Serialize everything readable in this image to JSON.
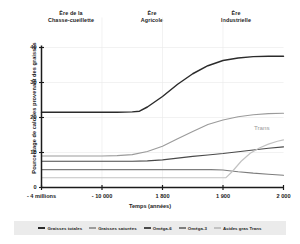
{
  "eras": [
    {
      "line1": "Ère de la",
      "line2": "Chasse-cueillette"
    },
    {
      "line1": "Ère",
      "line2": "Agricole"
    },
    {
      "line1": "Ère",
      "line2": "Industrielle"
    }
  ],
  "annotations": [
    {
      "text": "Trans",
      "color": "#9a9a9a"
    }
  ],
  "legend": [
    {
      "label": "Graisses totales",
      "color": "#2b2b2b"
    },
    {
      "label": "Graisses saturées",
      "color": "#9b9b9b"
    },
    {
      "label": "Oméga-6",
      "color": "#4a4a4a"
    },
    {
      "label": "Oméga-3",
      "color": "#7d7d7d"
    },
    {
      "label": "Acides gras Trans",
      "color": "#c2c2c2"
    }
  ],
  "chart_data": {
    "type": "line",
    "title": "",
    "xlabel": "Temps (années)",
    "ylabel": "Pourcentage de calories provenant des graisses",
    "ylim": [
      0,
      40
    ],
    "yticks": [
      0,
      10,
      20,
      30,
      40
    ],
    "ytick_labels": [
      "0",
      "10",
      "20",
      "30",
      "40"
    ],
    "x": [
      "- 4 millions",
      "- 10 000",
      "1 800",
      "1 900",
      "2 000"
    ],
    "xtick_labels": [
      "- 4 millions",
      "- 10 000",
      "1 800",
      "1 900",
      "2 000"
    ],
    "grid": true,
    "legend_position": "bottom",
    "series": [
      {
        "name": "Graisses totales",
        "color": "#2b2b2b",
        "values": [
          21.5,
          21.5,
          21.8,
          31.0,
          37.5
        ],
        "points": [
          [
            0,
            21.5
          ],
          [
            0.25,
            21.5
          ],
          [
            0.5,
            21.5
          ],
          [
            0.75,
            21.5
          ],
          [
            1.0,
            21.5
          ],
          [
            1.25,
            21.5
          ],
          [
            1.5,
            21.6
          ],
          [
            1.62,
            21.8
          ],
          [
            1.75,
            23.0
          ],
          [
            2.0,
            26.0
          ],
          [
            2.25,
            29.5
          ],
          [
            2.5,
            32.5
          ],
          [
            2.75,
            34.8
          ],
          [
            3.0,
            36.3
          ],
          [
            3.25,
            37.0
          ],
          [
            3.5,
            37.4
          ],
          [
            3.75,
            37.5
          ],
          [
            4.0,
            37.5
          ]
        ]
      },
      {
        "name": "Graisses saturées",
        "color": "#9b9b9b",
        "values": [
          9.0,
          9.0,
          9.6,
          17.5,
          21.2
        ],
        "points": [
          [
            0,
            9.0
          ],
          [
            0.25,
            9.0
          ],
          [
            0.5,
            9.0
          ],
          [
            0.75,
            9.0
          ],
          [
            1.0,
            9.0
          ],
          [
            1.25,
            9.1
          ],
          [
            1.5,
            9.4
          ],
          [
            1.75,
            10.3
          ],
          [
            2.0,
            11.8
          ],
          [
            2.25,
            13.9
          ],
          [
            2.5,
            16.0
          ],
          [
            2.75,
            18.0
          ],
          [
            3.0,
            19.3
          ],
          [
            3.25,
            20.2
          ],
          [
            3.5,
            20.8
          ],
          [
            3.75,
            21.1
          ],
          [
            4.0,
            21.2
          ]
        ]
      },
      {
        "name": "Oméga-6",
        "color": "#4a4a4a",
        "values": [
          7.5,
          7.5,
          7.6,
          9.6,
          11.6
        ],
        "points": [
          [
            0,
            7.5
          ],
          [
            0.5,
            7.5
          ],
          [
            1.0,
            7.5
          ],
          [
            1.5,
            7.5
          ],
          [
            1.75,
            7.6
          ],
          [
            2.0,
            7.9
          ],
          [
            2.25,
            8.4
          ],
          [
            2.5,
            8.9
          ],
          [
            2.75,
            9.3
          ],
          [
            3.0,
            9.7
          ],
          [
            3.25,
            10.2
          ],
          [
            3.5,
            10.7
          ],
          [
            3.75,
            11.2
          ],
          [
            4.0,
            11.6
          ]
        ]
      },
      {
        "name": "Oméga-3",
        "color": "#7d7d7d",
        "values": [
          5.1,
          5.1,
          5.1,
          5.0,
          3.5
        ],
        "points": [
          [
            0,
            5.1
          ],
          [
            0.5,
            5.1
          ],
          [
            1.0,
            5.1
          ],
          [
            1.5,
            5.1
          ],
          [
            2.0,
            5.1
          ],
          [
            2.5,
            5.1
          ],
          [
            2.8,
            5.1
          ],
          [
            3.0,
            5.0
          ],
          [
            3.1,
            4.8
          ],
          [
            3.25,
            4.5
          ],
          [
            3.5,
            4.1
          ],
          [
            3.75,
            3.8
          ],
          [
            4.0,
            3.5
          ]
        ]
      },
      {
        "name": "Acides gras Trans",
        "color": "#c2c2c2",
        "values": [
          2.8,
          2.8,
          2.8,
          2.8,
          13.6
        ],
        "points": [
          [
            0,
            2.8
          ],
          [
            0.5,
            2.8
          ],
          [
            1.0,
            2.8
          ],
          [
            1.5,
            2.8
          ],
          [
            2.0,
            2.8
          ],
          [
            2.5,
            2.8
          ],
          [
            2.9,
            2.8
          ],
          [
            3.05,
            2.8
          ],
          [
            3.15,
            4.5
          ],
          [
            3.3,
            7.5
          ],
          [
            3.45,
            9.8
          ],
          [
            3.6,
            11.3
          ],
          [
            3.75,
            12.4
          ],
          [
            3.9,
            13.2
          ],
          [
            4.0,
            13.6
          ]
        ]
      }
    ]
  }
}
